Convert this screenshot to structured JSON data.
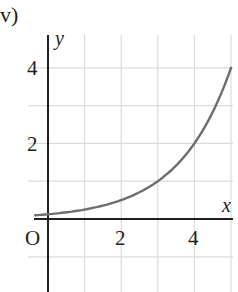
{
  "part_label": "v)",
  "chart_data": {
    "type": "line",
    "title": "",
    "xlabel": "x",
    "ylabel": "y",
    "origin_label": "O",
    "xlim": [
      -0.4,
      5.1
    ],
    "ylim": [
      -1.9,
      4.6
    ],
    "x_ticks": [
      2,
      4
    ],
    "x_tick_labels": [
      "2",
      "4"
    ],
    "y_ticks": [
      2,
      4
    ],
    "y_tick_labels": [
      "2",
      "4"
    ],
    "grid": true,
    "grid_step": 1,
    "series": [
      {
        "name": "curve",
        "equation": "y = 2^(x-3)",
        "x": [
          -0.35,
          0,
          1,
          2,
          3,
          4,
          5
        ],
        "y": [
          0.1,
          0.13,
          0.25,
          0.5,
          1,
          2,
          4
        ],
        "color": "#6d6e71"
      }
    ]
  },
  "colors": {
    "axis": "#231f20",
    "grid": "#dcdcdc",
    "curve": "#6d6e71"
  }
}
